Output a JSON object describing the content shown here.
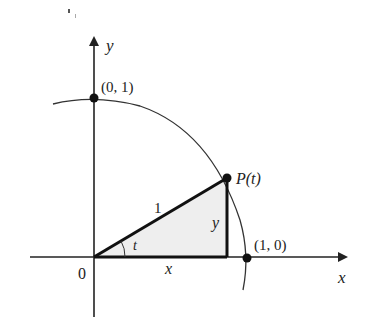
{
  "diagram": {
    "type": "unit-circle-trig",
    "axes": {
      "x_label": "x",
      "y_label": "y",
      "origin_label": "0"
    },
    "points": {
      "top": "(0, 1)",
      "right": "(1, 0)",
      "p": "P(t)"
    },
    "triangle": {
      "hypotenuse_label": "1",
      "adjacent_label": "x",
      "opposite_label": "y",
      "angle_label": "t"
    },
    "colors": {
      "stroke": "#222222",
      "shade": "#eeeeee"
    }
  }
}
